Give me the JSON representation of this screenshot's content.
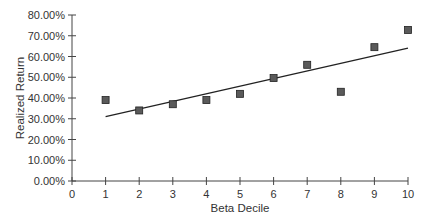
{
  "chart_data": {
    "type": "scatter",
    "title": "",
    "xlabel": "Beta Decile",
    "ylabel": "Realized Return",
    "xlim": [
      0,
      10
    ],
    "ylim": [
      0,
      0.8
    ],
    "x_ticks": [
      "0",
      "1",
      "2",
      "3",
      "4",
      "5",
      "6",
      "7",
      "8",
      "9",
      "10"
    ],
    "y_ticks": [
      "0.00%",
      "10.00%",
      "20.00%",
      "30.00%",
      "40.00%",
      "50.00%",
      "60.00%",
      "70.00%",
      "80.00%"
    ],
    "grid": false,
    "legend": null,
    "series": [
      {
        "name": "Realized Return",
        "marker": "square",
        "x": [
          1,
          2,
          3,
          4,
          5,
          6,
          7,
          8,
          9,
          10
        ],
        "values": [
          0.39,
          0.34,
          0.37,
          0.39,
          0.42,
          0.496,
          0.56,
          0.43,
          0.645,
          0.728
        ]
      },
      {
        "name": "Trend line",
        "type": "line",
        "x": [
          1,
          10
        ],
        "values": [
          0.31,
          0.64
        ]
      }
    ],
    "colors": {
      "marker_fill": "#5a5a5a",
      "marker_stroke": "#222222",
      "line": "#222222",
      "axis": "#444444"
    }
  }
}
